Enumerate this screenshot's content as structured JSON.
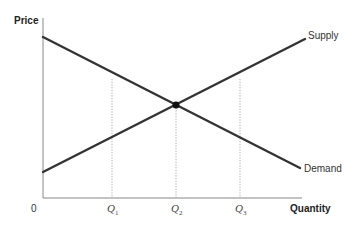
{
  "chart_data": {
    "type": "line",
    "title": "",
    "xlabel": "Quantity",
    "ylabel": "Price",
    "origin_label": "0",
    "x_ticks": [
      {
        "base": "Q",
        "sub": "1",
        "x": 112
      },
      {
        "base": "Q",
        "sub": "2",
        "x": 176
      },
      {
        "base": "Q",
        "sub": "3",
        "x": 240
      }
    ],
    "series": [
      {
        "name": "Supply",
        "points": [
          [
            43,
            172
          ],
          [
            305,
            39
          ]
        ],
        "color": "#333333"
      },
      {
        "name": "Demand",
        "points": [
          [
            43,
            37
          ],
          [
            300,
            168
          ]
        ],
        "color": "#333333"
      }
    ],
    "equilibrium": {
      "x": 176,
      "y": 105
    },
    "guide_lines": [
      {
        "x": 112,
        "y_top": 79
      },
      {
        "x": 176,
        "y_top": 105
      },
      {
        "x": 240,
        "y_top": 79
      }
    ],
    "grid": false,
    "legend": "inline labels at line ends"
  }
}
